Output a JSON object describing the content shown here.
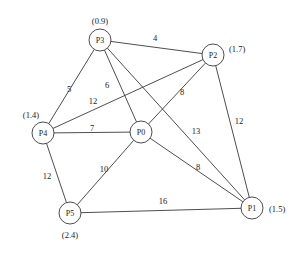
{
  "diagram": {
    "type": "weighted-undirected-graph",
    "background_color": "#ffffff",
    "stroke_color": "#3a3a3a",
    "text_color": "#1a1a1a",
    "nodes": [
      {
        "id": "P0",
        "label": "P0",
        "annotation": "",
        "x": 141,
        "y": 132,
        "r": 11,
        "ann_x": 141,
        "ann_y": 112,
        "ann_anchor": "middle"
      },
      {
        "id": "P1",
        "label": "P1",
        "annotation": "(1.5)",
        "x": 252,
        "y": 208,
        "r": 11,
        "ann_x": 269,
        "ann_y": 209,
        "ann_anchor": "start"
      },
      {
        "id": "P2",
        "label": "P2",
        "annotation": "(1.7)",
        "x": 213,
        "y": 55,
        "r": 11,
        "ann_x": 229,
        "ann_y": 49,
        "ann_anchor": "start"
      },
      {
        "id": "P3",
        "label": "P3",
        "annotation": "(0.9)",
        "x": 100,
        "y": 40,
        "r": 11,
        "ann_x": 100,
        "ann_y": 21,
        "ann_anchor": "middle"
      },
      {
        "id": "P4",
        "label": "P4",
        "annotation": "(1.4)",
        "x": 43,
        "y": 133,
        "r": 11,
        "ann_x": 31,
        "ann_y": 115,
        "ann_anchor": "middle"
      },
      {
        "id": "P5",
        "label": "P5",
        "annotation": "(2.4)",
        "x": 70,
        "y": 213,
        "r": 11,
        "ann_x": 70,
        "ann_y": 235,
        "ann_anchor": "middle"
      }
    ],
    "edges": [
      {
        "from": "P3",
        "to": "P2",
        "weight": "4",
        "lx": 155,
        "ly": 38
      },
      {
        "from": "P3",
        "to": "P4",
        "weight": "5",
        "lx": 69,
        "ly": 89
      },
      {
        "from": "P3",
        "to": "P0",
        "weight": "6",
        "lx": 107,
        "ly": 85
      },
      {
        "from": "P3",
        "to": "P1",
        "weight": "13",
        "lx": 196,
        "ly": 131
      },
      {
        "from": "P2",
        "to": "P4",
        "weight": "12",
        "lx": 93,
        "ly": 101
      },
      {
        "from": "P2",
        "to": "P0",
        "weight": "8",
        "lx": 182,
        "ly": 92
      },
      {
        "from": "P2",
        "to": "P1",
        "weight": "12",
        "lx": 239,
        "ly": 121
      },
      {
        "from": "P4",
        "to": "P0",
        "weight": "7",
        "lx": 92,
        "ly": 128
      },
      {
        "from": "P4",
        "to": "P5",
        "weight": "12",
        "lx": 47,
        "ly": 176
      },
      {
        "from": "P0",
        "to": "P5",
        "weight": "10",
        "lx": 104,
        "ly": 169
      },
      {
        "from": "P0",
        "to": "P1",
        "weight": "8",
        "lx": 198,
        "ly": 167
      },
      {
        "from": "P5",
        "to": "P1",
        "weight": "16",
        "lx": 163,
        "ly": 201
      }
    ]
  }
}
